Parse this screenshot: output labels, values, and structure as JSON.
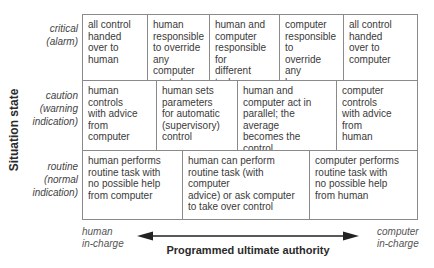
{
  "diagram": {
    "y_axis_title": "Situation state",
    "x_axis_title": "Programmed ultimate authority",
    "x_axis_left_label": "human\nin-charge",
    "x_axis_right_label": "computer\nin-charge",
    "rows": [
      {
        "label": "critical\n(alarm)",
        "cells": [
          "all control\nhanded\nover to\nhuman",
          "human\nresponsible\nto override\nany computer\ncontrol",
          "human and\ncomputer\nresponsible for\ndifferent tasks",
          "computer\nresponsible to\noverride any\nhuman\ncontrol",
          "all control\nhanded\nover to\ncomputer"
        ]
      },
      {
        "label": "caution\n(warning\nindication)",
        "cells": [
          "human controls\nwith advice from\ncomputer",
          "human sets\nparameters\nfor automatic\n(supervisory)\ncontrol",
          "human and\ncomputer act in\nparallel; the average\nbecomes the control\naction",
          "computer controls\nwith advice from\nhuman"
        ]
      },
      {
        "label": "routine\n(normal\nindication)",
        "cells": [
          "human performs\nroutine task with\nno possible help\nfrom computer",
          "human can perform\nroutine task (with computer\nadvice) or ask computer\nto take over control",
          "computer performs\nroutine task with\nno possible help\nfrom human"
        ]
      }
    ],
    "colors": {
      "grid_line": "#8a8a8a",
      "text": "#3a3a3a",
      "arrow": "#222222"
    }
  }
}
